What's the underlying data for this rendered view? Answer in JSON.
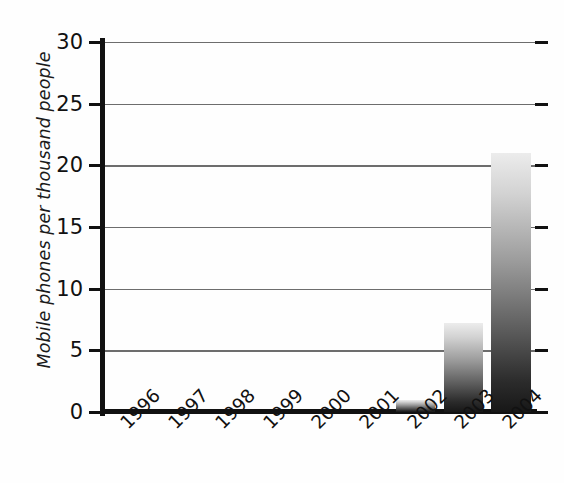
{
  "chart_data": {
    "type": "bar",
    "title": "",
    "subtitle": "",
    "xlabel": "",
    "ylabel": "Mobile phones per thousand people",
    "categories": [
      "1996",
      "1997",
      "1998",
      "1999",
      "2000",
      "2001",
      "2002",
      "2003",
      "2004"
    ],
    "values": [
      0,
      0,
      0,
      0,
      0,
      0,
      1.0,
      7.2,
      21.0
    ],
    "ylim": [
      0,
      30
    ],
    "yticks": [
      0,
      5,
      10,
      15,
      20,
      25,
      30
    ],
    "ytick_labels": [
      "0",
      "5",
      "10",
      "15",
      "20",
      "25",
      "30"
    ],
    "grid": "horizontal",
    "legend": "none",
    "series": [
      {
        "name": "Mobile phones per thousand people",
        "values": [
          0,
          0,
          0,
          0,
          0,
          0,
          1.0,
          7.2,
          21.0
        ]
      }
    ],
    "annotations": [],
    "colors": {
      "bar_gradient_top": "#ececec",
      "bar_gradient_bottom": "#171717",
      "axis": "#111111",
      "gridline": "#6d6d6d",
      "background": "#fefefe",
      "text": "#111111"
    }
  }
}
